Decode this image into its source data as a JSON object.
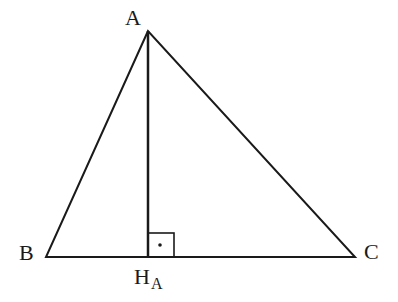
{
  "diagram": {
    "type": "triangle-altitude",
    "colors": {
      "stroke": "#1a1a1a",
      "background": "#ffffff"
    },
    "vertices": {
      "A": {
        "label": "A",
        "x": 148,
        "y": 31
      },
      "B": {
        "label": "B",
        "x": 46,
        "y": 257
      },
      "C": {
        "label": "C",
        "x": 355,
        "y": 257
      }
    },
    "foot": {
      "label": "H",
      "subscript": "A",
      "x": 148,
      "y": 257
    },
    "right_angle_marker": {
      "x": 148,
      "y": 233,
      "size": 26,
      "dot": true
    }
  }
}
